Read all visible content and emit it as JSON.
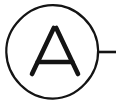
{
  "diagram": {
    "kind": "electrical-schematic-symbol",
    "title": "Ammeter",
    "canvas": {
      "width": 116,
      "height": 104,
      "background_color": "#ffffff"
    },
    "stroke_color": "#141414",
    "components": {
      "meter_body": {
        "name": "meter-circle",
        "shape": "circle",
        "center_x": 52,
        "center_y": 52,
        "radius_x": 46,
        "radius_y": 47,
        "stroke_width": 2.2,
        "fill": "none"
      },
      "meter_label": {
        "name": "meter-letter",
        "text": "A",
        "meaning": "Ammeter",
        "apex_x": 55,
        "apex_y": 28,
        "baseline_y": 74,
        "left_foot_x": 32,
        "right_foot_x": 78,
        "crossbar_y": 62,
        "stroke_width": 4.6
      },
      "lead_wire": {
        "name": "right-terminal-lead",
        "shape": "line",
        "x1": 97,
        "y1": 52,
        "x2": 116,
        "y2": 52,
        "stroke_width": 2.6
      }
    }
  }
}
